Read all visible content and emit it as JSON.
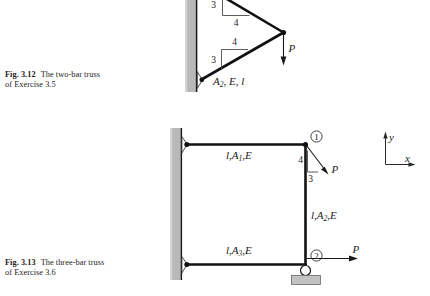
{
  "page": {
    "width": 430,
    "height": 296,
    "background": "#ffffff",
    "ink": "#1a1a1a",
    "wall_fill": "#b8b8b8"
  },
  "figure_312": {
    "caption_number": "Fig. 3.12",
    "caption_line1": "The two-bar truss",
    "caption_line2": "of Exercise 3.5",
    "labels": {
      "upper_slope_rise": "3",
      "upper_slope_run": "4",
      "lower_slope_run": "4",
      "lower_slope_rise": "3",
      "bar_label": "A",
      "bar_label_sub": "2",
      "bar_label_rest": ", E, l",
      "force": "P"
    }
  },
  "figure_313": {
    "caption_number": "Fig. 3.13",
    "caption_line1": "The three-bar truss",
    "caption_line2": "of Exercise 3.6",
    "labels": {
      "top_bar": "l,A",
      "top_bar_sub": "1",
      "top_bar_rest": ",E",
      "right_bar": "l,A",
      "right_bar_sub": "2",
      "right_bar_rest": ",E",
      "bottom_bar": "l,A",
      "bottom_bar_sub": "3",
      "bottom_bar_rest": ",E",
      "node_one": "①",
      "node_two": "②",
      "slope_rise": "4",
      "slope_run": "3",
      "force_inclined": "P",
      "force_horizontal": "P"
    },
    "axes": {
      "y_label": "y",
      "x_label": "x"
    }
  }
}
